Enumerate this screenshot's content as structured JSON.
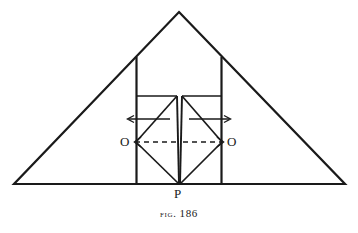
{
  "figure": {
    "caption_prefix": "Fig.",
    "caption_number": "186",
    "caption_full": "FIG. 186",
    "background_color": "#ffffff",
    "ink_color": "#1a1a1a"
  },
  "labels": {
    "origin_left": "O",
    "origin_right": "O",
    "apex_point": "P"
  },
  "geometry": {
    "outer_triangle": {
      "name": "outer-triangle",
      "apex": [
        179,
        12
      ],
      "base_left": [
        14,
        184
      ],
      "base_right": [
        345,
        184
      ]
    },
    "tall_rectangle": {
      "name": "tall-rectangle",
      "left": 136,
      "right": 222,
      "top": 57,
      "bottom": 184
    },
    "inner_box_left": {
      "name": "inner-box-left",
      "left": 136,
      "right": 177,
      "top": 96,
      "bottom": 184
    },
    "inner_box_right": {
      "name": "inner-box-right",
      "left": 182,
      "right": 222,
      "top": 96,
      "bottom": 184
    },
    "center_gap": {
      "name": "center-gap",
      "left_line_x": 177,
      "right_line_x": 182,
      "converge_point": [
        179.5,
        184
      ]
    },
    "axis_y": 142,
    "arrow_row_y": 119
  },
  "annotations": {
    "arrow_left_solid": {
      "name": "solid-arrow-left",
      "from": [
        170,
        119
      ],
      "to": [
        127,
        119
      ],
      "direction": "left"
    },
    "arrow_right_solid": {
      "name": "solid-arrow-right",
      "from": [
        189,
        119
      ],
      "to": [
        231,
        119
      ],
      "direction": "right"
    },
    "dashed_axis_left": {
      "name": "dashed-axis-left",
      "from": [
        177,
        142
      ],
      "to": [
        133,
        142
      ],
      "direction": "left",
      "style": "dashed"
    },
    "dashed_axis_right": {
      "name": "dashed-axis-right",
      "from": [
        182,
        142
      ],
      "to": [
        225,
        142
      ],
      "direction": "right",
      "style": "dashed"
    }
  }
}
